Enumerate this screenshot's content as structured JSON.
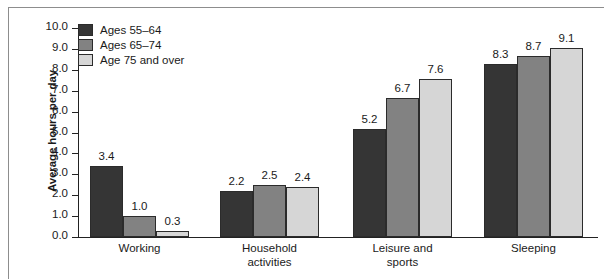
{
  "chart_data": {
    "type": "bar",
    "title": "",
    "xlabel": "",
    "ylabel": "Average hours per day",
    "ylim": [
      0.0,
      10.0
    ],
    "ytick_step": 1.0,
    "ytick_labels": [
      "10.0",
      "9.0",
      "8.0",
      "7.0",
      "6.0",
      "5.0",
      "4.0",
      "3.0",
      "2.0",
      "1.0",
      "0.0"
    ],
    "grid": false,
    "legend_position": "top-left",
    "categories": [
      "Working",
      "Household activities",
      "Leisure and sports",
      "Sleeping"
    ],
    "category_lines": [
      [
        "Working"
      ],
      [
        "Household",
        "activities"
      ],
      [
        "Leisure and",
        "sports"
      ],
      [
        "Sleeping"
      ]
    ],
    "series": [
      {
        "name": "Ages 55–64",
        "color": "#353535",
        "values": [
          3.4,
          2.2,
          5.2,
          8.3
        ],
        "value_labels": [
          "3.4",
          "2.2",
          "5.2",
          "8.3"
        ]
      },
      {
        "name": "Ages 65–74",
        "color": "#828282",
        "values": [
          1.0,
          2.5,
          6.7,
          8.7
        ],
        "value_labels": [
          "1.0",
          "2.5",
          "6.7",
          "8.7"
        ]
      },
      {
        "name": "Age 75 and over",
        "color": "#d6d6d6",
        "values": [
          0.3,
          2.4,
          7.6,
          9.1
        ],
        "value_labels": [
          "0.3",
          "2.4",
          "7.6",
          "9.1"
        ]
      }
    ]
  }
}
